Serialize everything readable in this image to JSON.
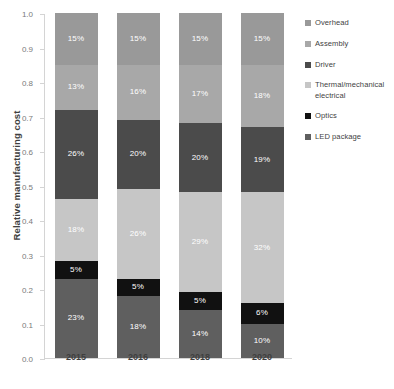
{
  "chart_data": {
    "type": "bar",
    "stacked": true,
    "title": "",
    "xlabel": "",
    "ylabel": "Relative manufacturing cost",
    "categories": [
      "2015",
      "2016",
      "2018",
      "2020"
    ],
    "ylim": [
      0.0,
      1.0
    ],
    "ytick_labels": [
      "0.0",
      "0.1",
      "0.2",
      "0.3",
      "0.4",
      "0.5",
      "0.6",
      "0.7",
      "0.8",
      "0.9",
      "1.0"
    ],
    "ytick_values": [
      0.0,
      0.1,
      0.2,
      0.3,
      0.4,
      0.5,
      0.6,
      0.7,
      0.8,
      0.9,
      1.0
    ],
    "grid": false,
    "legend_position": "right",
    "bar_totals": [
      1.0,
      0.9,
      0.72,
      0.59
    ],
    "stack_order_bottom_to_top": [
      "LED package",
      "Optics",
      "Thermal/mechanical electrical",
      "Driver",
      "Assembly",
      "Overhead"
    ],
    "series": [
      {
        "name": "LED package",
        "color": "#5f5f5f",
        "values": [
          0.23,
          0.18,
          0.14,
          0.1
        ],
        "labels": [
          "23%",
          "18%",
          "14%",
          "10%"
        ]
      },
      {
        "name": "Optics",
        "color": "#111111",
        "values": [
          0.05,
          0.05,
          0.05,
          0.06
        ],
        "labels": [
          "5%",
          "5%",
          "5%",
          "6%"
        ]
      },
      {
        "name": "Thermal/mechanical electrical",
        "color": "#c6c6c6",
        "values": [
          0.18,
          0.26,
          0.29,
          0.32
        ],
        "labels": [
          "18%",
          "26%",
          "29%",
          "32%"
        ]
      },
      {
        "name": "Driver",
        "color": "#4b4b4b",
        "values": [
          0.26,
          0.2,
          0.2,
          0.19
        ],
        "labels": [
          "26%",
          "20%",
          "20%",
          "19%"
        ]
      },
      {
        "name": "Assembly",
        "color": "#a8a8a8",
        "values": [
          0.13,
          0.16,
          0.17,
          0.18
        ],
        "labels": [
          "13%",
          "16%",
          "17%",
          "18%"
        ]
      },
      {
        "name": "Overhead",
        "color": "#999999",
        "values": [
          0.15,
          0.15,
          0.15,
          0.15
        ],
        "labels": [
          "15%",
          "15%",
          "15%",
          "15%"
        ]
      }
    ]
  },
  "legend": {
    "items": [
      {
        "label": "Overhead",
        "color": "#999999"
      },
      {
        "label": "Assembly",
        "color": "#a8a8a8"
      },
      {
        "label": "Driver",
        "color": "#4b4b4b"
      },
      {
        "label": "Thermal/mechanical electrical",
        "color": "#c6c6c6"
      },
      {
        "label": "Optics",
        "color": "#111111"
      },
      {
        "label": "LED package",
        "color": "#5f5f5f"
      }
    ]
  }
}
